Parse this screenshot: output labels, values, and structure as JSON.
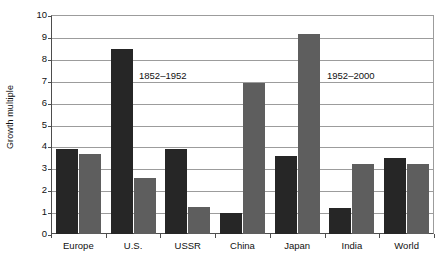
{
  "chart_data": {
    "type": "bar",
    "title": "",
    "xlabel": "",
    "ylabel": "Growth multiple",
    "ylim": [
      0,
      10
    ],
    "ytick_labels": [
      "10",
      "9",
      "8",
      "7",
      "6",
      "5",
      "4",
      "3",
      "2",
      "1",
      "0"
    ],
    "ytick_values": [
      10,
      9,
      8,
      7,
      6,
      5,
      4,
      3,
      2,
      1,
      0
    ],
    "grid": true,
    "legend_position": "none",
    "categories": [
      "Europe",
      "U.S.",
      "USSR",
      "China",
      "Japan",
      "India",
      "World"
    ],
    "series": [
      {
        "name": "1852–1952",
        "color": "#262626",
        "values": [
          3.9,
          8.45,
          3.9,
          0.95,
          3.55,
          1.2,
          3.45
        ]
      },
      {
        "name": "1952–2000",
        "color": "#5e5e5e",
        "values": [
          3.65,
          2.55,
          1.25,
          6.9,
          9.15,
          3.2,
          3.2
        ]
      }
    ],
    "annotations": [
      {
        "text": "1852–1952",
        "x_px": 137,
        "y_px": 70
      },
      {
        "text": "1952–2000",
        "x_px": 325,
        "y_px": 70
      }
    ]
  },
  "colors": {
    "period1": "#262626",
    "period2": "#5e5e5e",
    "gridline": "#9c9c9c",
    "axis": "#4d4d4d",
    "background": "#ffffff",
    "text": "#111111"
  }
}
